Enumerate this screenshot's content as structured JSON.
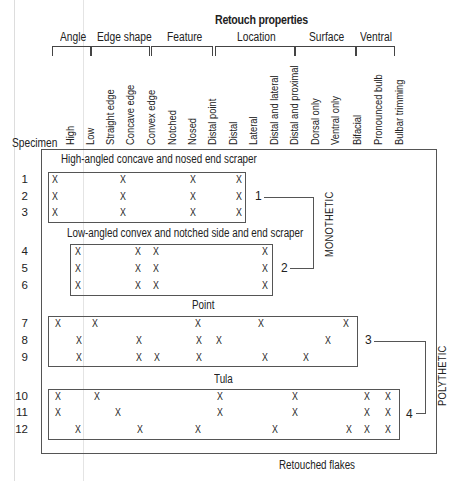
{
  "chart_data": {
    "type": "table",
    "title": "Retouch properties",
    "row_header": "Specimen",
    "groups": [
      {
        "name": "Angle",
        "columns": [
          "High",
          "Low"
        ]
      },
      {
        "name": "Edge shape",
        "columns": [
          "Straight edge",
          "Concave edge",
          "Convex edge"
        ]
      },
      {
        "name": "Feature",
        "columns": [
          "Notched",
          "Nosed",
          "Distal point"
        ]
      },
      {
        "name": "Location",
        "columns": [
          "Distal",
          "Lateral",
          "Distal and lateral",
          "Distal and proximal"
        ]
      },
      {
        "name": "Surface",
        "columns": [
          "Dorsal only",
          "Ventral only",
          "Bifacial"
        ]
      },
      {
        "name": "Ventral",
        "columns": [
          "Pronounced bulb",
          "Bulbar trimming"
        ]
      }
    ],
    "clusters": [
      {
        "id": "1",
        "label": "High-angled concave and nosed end scraper",
        "specimens": [
          1,
          2,
          3
        ],
        "class": "MONOTHETIC"
      },
      {
        "id": "2",
        "label": "Low-angled convex and notched side and end scraper",
        "specimens": [
          4,
          5,
          6
        ],
        "class": "MONOTHETIC"
      },
      {
        "id": "3",
        "label": "Point",
        "specimens": [
          7,
          8,
          9
        ],
        "class": "POLYTHETIC"
      },
      {
        "id": "4",
        "label": "Tula",
        "specimens": [
          10,
          11,
          12
        ],
        "class": "POLYTHETIC"
      }
    ],
    "outer_label": "Retouched flakes",
    "rows": [
      {
        "specimen": "1",
        "marks_x": [
          55,
          123,
          193,
          239
        ]
      },
      {
        "specimen": "2",
        "marks_x": [
          55,
          123,
          193,
          239
        ]
      },
      {
        "specimen": "3",
        "marks_x": [
          55,
          123,
          193,
          239
        ]
      },
      {
        "specimen": "4",
        "marks_x": [
          78,
          138,
          156,
          265
        ]
      },
      {
        "specimen": "5",
        "marks_x": [
          78,
          138,
          156,
          265
        ]
      },
      {
        "specimen": "6",
        "marks_x": [
          78,
          138,
          156,
          265
        ]
      },
      {
        "specimen": "7",
        "marks_x": [
          58,
          95,
          198,
          261,
          346
        ]
      },
      {
        "specimen": "8",
        "marks_x": [
          79,
          139,
          199,
          219,
          328
        ]
      },
      {
        "specimen": "9",
        "marks_x": [
          79,
          139,
          157,
          199,
          265,
          306
        ]
      },
      {
        "specimen": "10",
        "marks_x": [
          58,
          97,
          220,
          295,
          367,
          388
        ]
      },
      {
        "specimen": "11",
        "marks_x": [
          58,
          118,
          220,
          295,
          367,
          388
        ]
      },
      {
        "specimen": "12",
        "marks_x": [
          78,
          140,
          198,
          275,
          349,
          367,
          388
        ]
      }
    ]
  },
  "header": {
    "title": "Retouch properties",
    "specimen_label": "Specimen",
    "groups": [
      {
        "label": "Angle",
        "x": 60,
        "bx": 52,
        "bw": 37
      },
      {
        "label": "Edge shape",
        "x": 97,
        "bx": 91,
        "bw": 57
      },
      {
        "label": "Feature",
        "x": 167,
        "bx": 151,
        "bw": 60
      },
      {
        "label": "Location",
        "x": 237,
        "bx": 215,
        "bw": 78
      },
      {
        "label": "Surface",
        "x": 309,
        "bx": 295,
        "bw": 59
      },
      {
        "label": "Ventral",
        "x": 360,
        "bx": 356,
        "bw": 37
      }
    ],
    "columns": [
      {
        "label": "High",
        "x": 58
      },
      {
        "label": "Low",
        "x": 78
      },
      {
        "label": "Straight edge",
        "x": 98
      },
      {
        "label": "Concave edge",
        "x": 118
      },
      {
        "label": "Convex edge",
        "x": 139
      },
      {
        "label": "Notched",
        "x": 160
      },
      {
        "label": "Nosed",
        "x": 180
      },
      {
        "label": "Distal point",
        "x": 200
      },
      {
        "label": "Distal",
        "x": 221
      },
      {
        "label": "Lateral",
        "x": 241
      },
      {
        "label": "Distal and lateral",
        "x": 262
      },
      {
        "label": "Distal and proximal",
        "x": 282
      },
      {
        "label": "Dorsal only",
        "x": 303
      },
      {
        "label": "Ventral only",
        "x": 323
      },
      {
        "label": "Bifacial",
        "x": 345
      },
      {
        "label": "Pronounced bulb",
        "x": 366
      },
      {
        "label": "Bulbar trimming",
        "x": 387
      }
    ]
  },
  "labels": {
    "cluster1": "High-angled concave and nosed end scraper",
    "cluster2": "Low-angled convex and notched side and end scraper",
    "cluster3": "Point",
    "cluster4": "Tula",
    "num1": "1",
    "num2": "2",
    "num3": "3",
    "num4": "4",
    "monothetic": "MONOTHETIC",
    "polythetic": "POLYTHETIC",
    "outer": "Retouched flakes",
    "mark": "X"
  }
}
